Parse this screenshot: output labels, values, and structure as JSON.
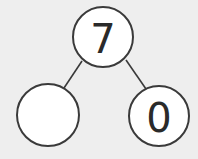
{
  "diagram": {
    "type": "number-bond",
    "whole": {
      "label": "7",
      "cx": 103,
      "cy": 37,
      "r": 30
    },
    "parts": [
      {
        "label": "",
        "cx": 48,
        "cy": 115,
        "r": 31
      },
      {
        "label": "0",
        "cx": 159,
        "cy": 116,
        "r": 30
      }
    ],
    "edges": [
      {
        "from": "whole",
        "to": "part-left",
        "x1": 82,
        "y1": 61,
        "x2": 64,
        "y2": 88
      },
      {
        "from": "whole",
        "to": "part-right",
        "x1": 126,
        "y1": 60,
        "x2": 146,
        "y2": 89
      }
    ],
    "colors": {
      "background": "#eeeeee",
      "node_fill": "#ffffff",
      "stroke": "#3a3a3a",
      "text": "#2a2a2a"
    }
  }
}
